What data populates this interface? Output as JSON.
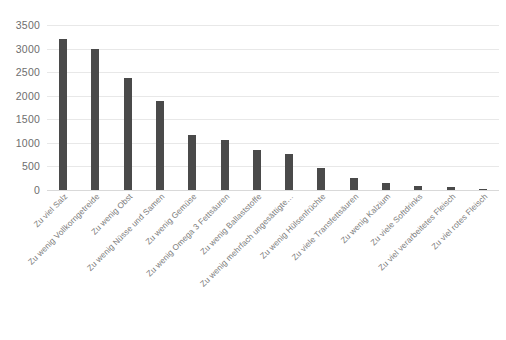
{
  "chart_data": {
    "type": "bar",
    "title": "",
    "xlabel": "",
    "ylabel": "",
    "ylim": [
      0,
      3500
    ],
    "yticks": [
      0,
      500,
      1000,
      1500,
      2000,
      2500,
      3000,
      3500
    ],
    "grid": true,
    "legend": "none",
    "bar_color": "#4a4a4a",
    "categories": [
      "Zu viel Salz",
      "Zu wenig Vollkorngetreide",
      "Zu wenig Obst",
      "Zu wenig Nüsse und Samen",
      "Zu wenig Gemüse",
      "Zu wenig Omega 3 Fettsäuren",
      "Zu wenig Ballaststoffe",
      "Zu wenig mehrfach ungesättigte…",
      "Zu wenig Hülsenfrüchte",
      "Zu viele Transfettsäuren",
      "Zu wenig Kalzium",
      "Zu viele Softdrinks",
      "Zu viel verarbeitetes Fleisch",
      "Zu viel rotes Fleisch"
    ],
    "values": [
      3200,
      2990,
      2380,
      1880,
      1170,
      1060,
      850,
      760,
      470,
      250,
      150,
      85,
      60,
      25
    ]
  },
  "caption": {
    "text": ""
  }
}
